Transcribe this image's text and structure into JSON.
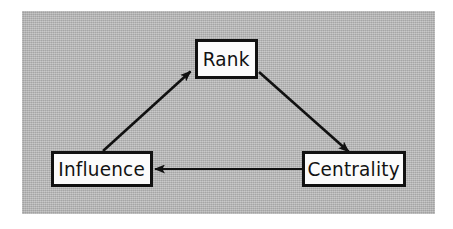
{
  "figure": {
    "kind": "cycle-diagram",
    "caption": "",
    "panel": {
      "background_color": "#b5b5b5",
      "page_background_color": "#ffffff"
    },
    "style": {
      "box_fill_color": "#fbfbfb",
      "box_border_color": "#111111",
      "arrow_color": "#111111",
      "label_color": "#121212"
    }
  },
  "nodes": [
    {
      "id": "rank",
      "label": "Rank"
    },
    {
      "id": "influence",
      "label": "Influence"
    },
    {
      "id": "centrality",
      "label": "Centrality"
    }
  ],
  "edges": [
    {
      "id": "influence-to-rank",
      "from": "Influence",
      "to": "Rank",
      "label": "",
      "direction": "up-right"
    },
    {
      "id": "rank-to-centrality",
      "from": "Rank",
      "to": "Centrality",
      "label": "",
      "direction": "down-right"
    },
    {
      "id": "centrality-to-influence",
      "from": "Centrality",
      "to": "Influence",
      "label": "",
      "direction": "left"
    }
  ],
  "icons": {
    "arrowhead": "arrowhead-icon"
  }
}
